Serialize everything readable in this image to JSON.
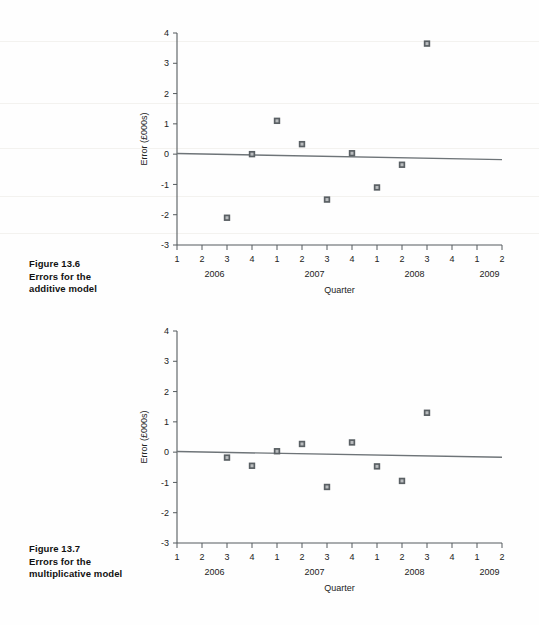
{
  "page": {
    "background": "#fefefe",
    "width": 539,
    "height": 625
  },
  "figures": [
    {
      "id": "figure-13-6",
      "caption_lines": [
        "Figure 13.6",
        "Errors for the",
        "additive model"
      ],
      "number": "Figure 13.6"
    },
    {
      "id": "figure-13-7",
      "caption_lines": [
        "Figure 13.7",
        "Errors for the",
        "multiplicative model"
      ],
      "number": "Figure 13.7"
    }
  ],
  "chart_data": [
    {
      "type": "scatter",
      "id": "errors-additive-model",
      "title": "",
      "xlabel": "Quarter",
      "ylabel": "Error (£000s)",
      "ylim": [
        -3,
        4
      ],
      "yticks": [
        4,
        3,
        2,
        1,
        0,
        -1,
        -2,
        -3
      ],
      "ytick_labels": [
        "4",
        "3",
        "2",
        "1",
        "0",
        "-1",
        "-2",
        "-3"
      ],
      "grid": false,
      "legend": "none",
      "x_tick_labels": [
        "1",
        "2",
        "3",
        "4",
        "1",
        "2",
        "3",
        "4",
        "1",
        "2",
        "3",
        "4",
        "1",
        "2"
      ],
      "x_group_labels": [
        {
          "label": "2006",
          "center_index": 1.5
        },
        {
          "label": "2007",
          "center_index": 5.5
        },
        {
          "label": "2008",
          "center_index": 9.5
        },
        {
          "label": "2009",
          "center_index": 12.5
        }
      ],
      "points": [
        {
          "x_index": 2,
          "period": "2006 Q3",
          "y": -2.1
        },
        {
          "x_index": 3,
          "period": "2006 Q4",
          "y": 0.0
        },
        {
          "x_index": 4,
          "period": "2007 Q1",
          "y": 1.1
        },
        {
          "x_index": 5,
          "period": "2007 Q2",
          "y": 0.33
        },
        {
          "x_index": 6,
          "period": "2007 Q3",
          "y": -1.5
        },
        {
          "x_index": 7,
          "period": "2007 Q4",
          "y": 0.03
        },
        {
          "x_index": 8,
          "period": "2008 Q1",
          "y": -1.1
        },
        {
          "x_index": 9,
          "period": "2008 Q2",
          "y": -0.35
        },
        {
          "x_index": 10,
          "period": "2008 Q3",
          "y": 3.65
        }
      ],
      "trend_line": {
        "y_at_left": 0.02,
        "y_at_right": -0.18
      }
    },
    {
      "type": "scatter",
      "id": "errors-multiplicative-model",
      "title": "",
      "xlabel": "Quarter",
      "ylabel": "Error (£000s)",
      "ylim": [
        -3,
        4
      ],
      "yticks": [
        4,
        3,
        2,
        1,
        0,
        -1,
        -2,
        -3
      ],
      "ytick_labels": [
        "4",
        "3",
        "2",
        "1",
        "0",
        "-1",
        "-2",
        "-3"
      ],
      "grid": false,
      "legend": "none",
      "x_tick_labels": [
        "1",
        "2",
        "3",
        "4",
        "1",
        "2",
        "3",
        "4",
        "1",
        "2",
        "3",
        "4",
        "1",
        "2"
      ],
      "x_group_labels": [
        {
          "label": "2006",
          "center_index": 1.5
        },
        {
          "label": "2007",
          "center_index": 5.5
        },
        {
          "label": "2008",
          "center_index": 9.5
        },
        {
          "label": "2009",
          "center_index": 12.5
        }
      ],
      "points": [
        {
          "x_index": 2,
          "period": "2006 Q3",
          "y": -0.18
        },
        {
          "x_index": 3,
          "period": "2006 Q4",
          "y": -0.45
        },
        {
          "x_index": 4,
          "period": "2007 Q1",
          "y": 0.03
        },
        {
          "x_index": 5,
          "period": "2007 Q2",
          "y": 0.27
        },
        {
          "x_index": 6,
          "period": "2007 Q3",
          "y": -1.15
        },
        {
          "x_index": 7,
          "period": "2007 Q4",
          "y": 0.32
        },
        {
          "x_index": 8,
          "period": "2008 Q1",
          "y": -0.47
        },
        {
          "x_index": 9,
          "period": "2008 Q2",
          "y": -0.95
        },
        {
          "x_index": 10,
          "period": "2008 Q3",
          "y": 1.3
        }
      ],
      "trend_line": {
        "y_at_left": 0.02,
        "y_at_right": -0.17
      }
    }
  ],
  "style": {
    "axis_color": "#555b5e",
    "trend_color": "#6e7478",
    "marker_fill": "#5a6064",
    "marker_inner": "#b9bcbe",
    "text_color": "#222222"
  }
}
